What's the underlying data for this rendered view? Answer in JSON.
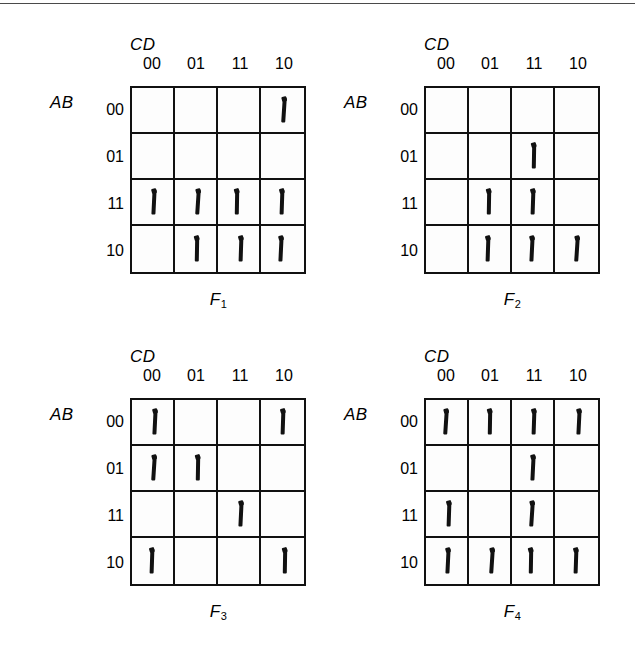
{
  "figure": {
    "column_group_label": "CD",
    "row_group_label": "AB",
    "column_headers": [
      "00",
      "01",
      "11",
      "10"
    ],
    "row_headers": [
      "00",
      "01",
      "11",
      "10"
    ],
    "divider_color": "#4a4a4a",
    "ink_color": "#111111"
  },
  "chart_data": {
    "type": "table",
    "title": "",
    "xlabel": "CD",
    "ylabel": "AB",
    "categories": [
      "00",
      "01",
      "11",
      "10"
    ],
    "row_categories": [
      "00",
      "01",
      "11",
      "10"
    ],
    "legend": [
      "F1",
      "F2",
      "F3",
      "F4"
    ],
    "maps": [
      {
        "name": "F1",
        "name_base": "F",
        "name_sub": "1",
        "values": [
          [
            0,
            0,
            0,
            1
          ],
          [
            0,
            0,
            0,
            0
          ],
          [
            1,
            1,
            1,
            1
          ],
          [
            0,
            1,
            1,
            1
          ]
        ],
        "minterms": [
          2,
          12,
          13,
          15,
          14,
          9,
          11,
          10
        ]
      },
      {
        "name": "F2",
        "name_base": "F",
        "name_sub": "2",
        "values": [
          [
            0,
            0,
            0,
            0
          ],
          [
            0,
            0,
            1,
            0
          ],
          [
            0,
            1,
            1,
            0
          ],
          [
            0,
            1,
            1,
            1
          ]
        ],
        "minterms": [
          7,
          13,
          15,
          9,
          11,
          10
        ]
      },
      {
        "name": "F3",
        "name_base": "F",
        "name_sub": "3",
        "values": [
          [
            1,
            0,
            0,
            1
          ],
          [
            1,
            1,
            0,
            0
          ],
          [
            0,
            0,
            1,
            0
          ],
          [
            1,
            0,
            0,
            1
          ]
        ],
        "minterms": [
          0,
          2,
          4,
          5,
          15,
          8,
          10
        ]
      },
      {
        "name": "F4",
        "name_base": "F",
        "name_sub": "4",
        "values": [
          [
            1,
            1,
            1,
            1
          ],
          [
            0,
            0,
            1,
            0
          ],
          [
            1,
            0,
            1,
            0
          ],
          [
            1,
            1,
            1,
            1
          ]
        ],
        "minterms": [
          0,
          1,
          3,
          2,
          7,
          12,
          15,
          8,
          9,
          11,
          10
        ]
      }
    ]
  }
}
